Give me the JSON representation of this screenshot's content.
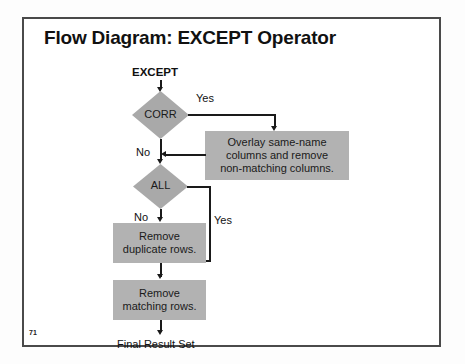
{
  "slide": {
    "title": "Flow Diagram: EXCEPT Operator",
    "page_number": "71",
    "frame_border_color": "#4a4a4a",
    "background_color": "#ffffff"
  },
  "colors": {
    "diamond_fill": "#a9a9a9",
    "box_fill": "#b2b2b2",
    "connector": "#1a1a1a",
    "text": "#111111"
  },
  "flow": {
    "entry_label": "EXCEPT",
    "exit_label": "Final Result Set",
    "decisions": [
      {
        "id": "corr",
        "label": "CORR",
        "yes_label": "Yes",
        "no_label": "No"
      },
      {
        "id": "all",
        "label": "ALL",
        "yes_label": "Yes",
        "no_label": "No"
      }
    ],
    "processes": [
      {
        "id": "overlay",
        "line1": "Overlay same-name",
        "line2": "columns and remove",
        "line3": "non-matching columns."
      },
      {
        "id": "remove-duplicates",
        "line1": "Remove",
        "line2": "duplicate rows."
      },
      {
        "id": "remove-matching",
        "line1": "Remove",
        "line2": "matching rows."
      }
    ]
  }
}
